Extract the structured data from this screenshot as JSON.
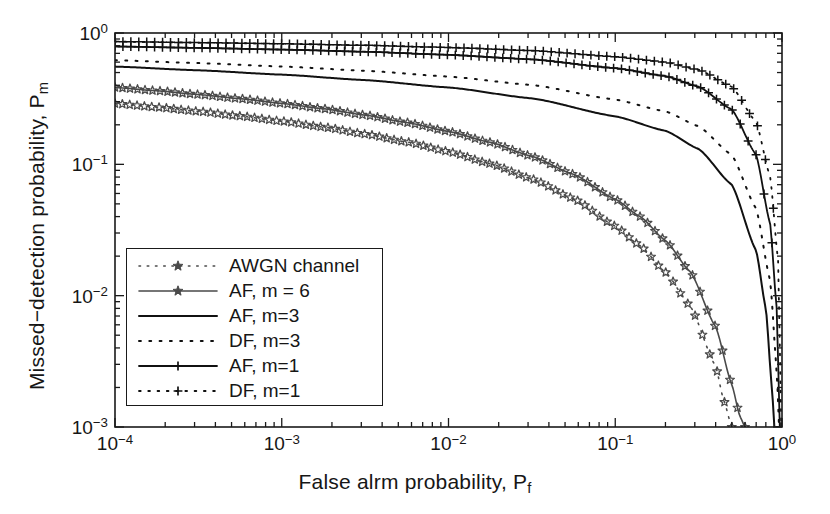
{
  "figure": {
    "width": 830,
    "height": 514,
    "background": "#ffffff",
    "axes_color": "#1a1a1a"
  },
  "chart_data": {
    "type": "line",
    "title": "",
    "xlabel": "False alrm probability, P",
    "xlabel_sub": "f",
    "ylabel": "Missed−detection probability, P",
    "ylabel_sub": "m",
    "xscale": "log",
    "yscale": "log",
    "xlim": [
      0.0001,
      1
    ],
    "ylim": [
      0.001,
      1
    ],
    "grid": false,
    "legend_position": "lower-left-inside",
    "xticks": [
      {
        "value": 0.0001,
        "label_mantissa": "10",
        "label_exp": "−4"
      },
      {
        "value": 0.001,
        "label_mantissa": "10",
        "label_exp": "−3"
      },
      {
        "value": 0.01,
        "label_mantissa": "10",
        "label_exp": "−2"
      },
      {
        "value": 0.1,
        "label_mantissa": "10",
        "label_exp": "−1"
      },
      {
        "value": 1,
        "label_mantissa": "10",
        "label_exp": "0"
      }
    ],
    "yticks": [
      {
        "value": 1,
        "label_mantissa": "10",
        "label_exp": "0"
      },
      {
        "value": 0.1,
        "label_mantissa": "10",
        "label_exp": "−1"
      },
      {
        "value": 0.01,
        "label_mantissa": "10",
        "label_exp": "−2"
      },
      {
        "value": 0.001,
        "label_mantissa": "10",
        "label_exp": "−3"
      }
    ],
    "series": [
      {
        "name": "AWGN channel",
        "color": "#4a4a4a",
        "style": "dotted",
        "marker": "star",
        "linewidth": 1.6,
        "x": [
          0.0001,
          0.000178,
          0.000316,
          0.000562,
          0.001,
          0.00178,
          0.00316,
          0.00562,
          0.01,
          0.0178,
          0.0316,
          0.0562,
          0.1,
          0.141,
          0.2,
          0.282,
          0.4,
          0.447,
          0.5
        ],
        "y": [
          0.29,
          0.272,
          0.253,
          0.233,
          0.213,
          0.192,
          0.17,
          0.148,
          0.125,
          0.101,
          0.0775,
          0.0548,
          0.0338,
          0.024,
          0.0151,
          0.0083,
          0.0029,
          0.0016,
          0.001
        ]
      },
      {
        "name": "AF, m = 6",
        "color": "#4a4a4a",
        "style": "solid",
        "marker": "star",
        "linewidth": 1.6,
        "x": [
          0.0001,
          0.000178,
          0.000316,
          0.000562,
          0.001,
          0.00178,
          0.00316,
          0.00562,
          0.01,
          0.0178,
          0.0316,
          0.0562,
          0.1,
          0.141,
          0.2,
          0.282,
          0.4,
          0.5,
          0.56,
          0.6
        ],
        "y": [
          0.385,
          0.363,
          0.34,
          0.316,
          0.291,
          0.265,
          0.237,
          0.208,
          0.178,
          0.147,
          0.115,
          0.084,
          0.0543,
          0.04,
          0.0263,
          0.0152,
          0.0058,
          0.0021,
          0.0012,
          0.001
        ]
      },
      {
        "name": "AF, m=3",
        "color": "#111111",
        "style": "solid",
        "marker": "none",
        "linewidth": 2.0,
        "x": [
          0.0001,
          0.000316,
          0.001,
          0.00316,
          0.01,
          0.0316,
          0.1,
          0.2,
          0.316,
          0.5,
          0.7,
          0.8,
          0.87,
          0.9
        ],
        "y": [
          0.555,
          0.52,
          0.482,
          0.438,
          0.385,
          0.318,
          0.232,
          0.18,
          0.131,
          0.07,
          0.022,
          0.008,
          0.002,
          0.001
        ]
      },
      {
        "name": "DF, m=3",
        "color": "#111111",
        "style": "dotted",
        "marker": "none",
        "linewidth": 2.0,
        "x": [
          0.0001,
          0.000316,
          0.001,
          0.00316,
          0.01,
          0.0316,
          0.1,
          0.2,
          0.316,
          0.5,
          0.7,
          0.85,
          0.93,
          0.96
        ],
        "y": [
          0.62,
          0.59,
          0.556,
          0.516,
          0.466,
          0.402,
          0.311,
          0.253,
          0.195,
          0.118,
          0.046,
          0.013,
          0.0027,
          0.001
        ]
      },
      {
        "name": "AF, m=1",
        "color": "#111111",
        "style": "solid",
        "marker": "plus",
        "linewidth": 1.8,
        "x": [
          0.0001,
          0.000316,
          0.001,
          0.00316,
          0.01,
          0.0316,
          0.1,
          0.2,
          0.316,
          0.5,
          0.7,
          0.85,
          0.93,
          0.97
        ],
        "y": [
          0.79,
          0.77,
          0.748,
          0.72,
          0.682,
          0.63,
          0.54,
          0.47,
          0.39,
          0.262,
          0.118,
          0.035,
          0.008,
          0.001
        ]
      },
      {
        "name": "DF, m=1",
        "color": "#111111",
        "style": "dotted",
        "marker": "plus",
        "linewidth": 1.8,
        "x": [
          0.0001,
          0.000316,
          0.001,
          0.00316,
          0.01,
          0.0316,
          0.1,
          0.2,
          0.316,
          0.5,
          0.7,
          0.85,
          0.95,
          0.99
        ],
        "y": [
          0.86,
          0.845,
          0.828,
          0.806,
          0.776,
          0.735,
          0.66,
          0.6,
          0.525,
          0.39,
          0.21,
          0.08,
          0.018,
          0.001
        ]
      }
    ]
  },
  "legend": {
    "entries": [
      {
        "label": "AWGN channel"
      },
      {
        "label": "AF, m = 6"
      },
      {
        "label": "AF, m=3"
      },
      {
        "label": "DF, m=3"
      },
      {
        "label": "AF, m=1"
      },
      {
        "label": "DF, m=1"
      }
    ]
  }
}
